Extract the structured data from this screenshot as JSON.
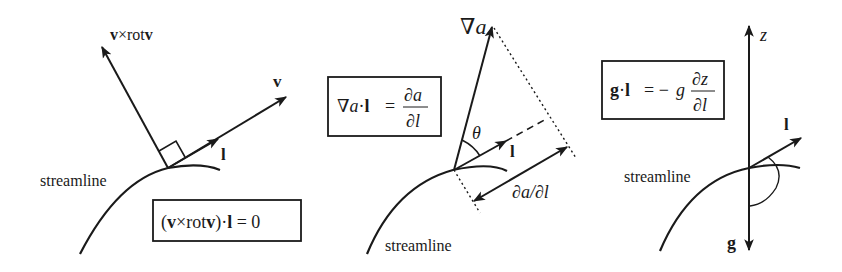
{
  "panels": [
    {
      "id": "panel-1",
      "vectors": {
        "normal_label_bold1": "v",
        "normal_label_mid": "×rot",
        "normal_label_bold2": "v",
        "velocity_label": "v",
        "tangent_label": "l"
      },
      "streamline_label": "streamline",
      "equation": {
        "open": "(",
        "v1": "v",
        "cross": "×rot",
        "v2": "v",
        "close": ")·",
        "l": "l",
        "rest": " = 0"
      }
    },
    {
      "id": "panel-2",
      "vectors": {
        "gradient_label_nabla": "∇",
        "gradient_label_a": "a",
        "tangent_label": "l",
        "angle_label": "θ",
        "projection_label": "∂a/∂l"
      },
      "streamline_label": "streamline",
      "equation": {
        "lhs_nabla": "∇",
        "lhs_a": "a",
        "lhs_dot": "·",
        "lhs_l": "l",
        "eq": "=",
        "num": "∂a",
        "den": "∂l"
      }
    },
    {
      "id": "panel-3",
      "vectors": {
        "z_label": "z",
        "tangent_label": "l",
        "gravity_label": "g"
      },
      "streamline_label": "streamline",
      "equation": {
        "lhs_g": "g",
        "lhs_dot": "·",
        "lhs_l": "l",
        "eq": "= −",
        "g": "g",
        "num": "∂z",
        "den": "∂l"
      }
    }
  ],
  "colors": {
    "ink": "#1a1a1a",
    "background": "#ffffff"
  }
}
